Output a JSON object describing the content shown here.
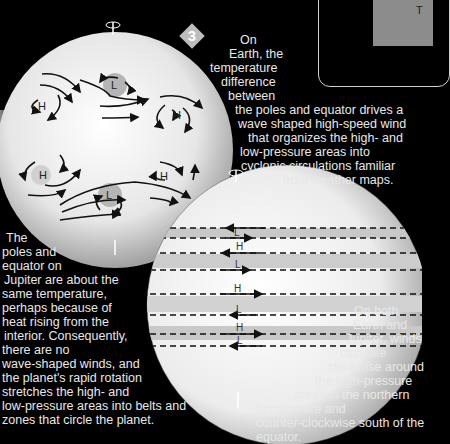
{
  "badge": {
    "number": "3",
    "color": "#bdbdbd"
  },
  "inset": {
    "letter": "T"
  },
  "earth_globe": {
    "label": "Earth",
    "pressure_labels": [
      {
        "id": "north-low",
        "text": "L"
      },
      {
        "id": "north-high-left",
        "text": "H"
      },
      {
        "id": "north-high-right",
        "text": "H"
      },
      {
        "id": "south-high-left",
        "text": "H"
      },
      {
        "id": "south-high-right",
        "text": "H"
      },
      {
        "id": "south-low",
        "text": "L"
      }
    ]
  },
  "jupiter_globe": {
    "label": "Jupiter",
    "bands": [
      {
        "text": "L",
        "direction": "east"
      },
      {
        "text": "H",
        "direction": "west"
      },
      {
        "text": "L",
        "direction": "east"
      },
      {
        "text": "H",
        "direction": "east"
      },
      {
        "text": "L",
        "direction": "west"
      },
      {
        "text": "H",
        "direction": "east"
      },
      {
        "text": "L",
        "direction": "west"
      }
    ]
  },
  "captions": {
    "earth": [
      "On",
      "Earth, the",
      "temperature",
      "difference",
      "between",
      "the poles and equator drives a",
      "wave shaped high-speed wind",
      "that organizes the high- and",
      "low-pressure areas into",
      "cyclonic circulations familiar",
      "from weather maps."
    ],
    "jupiter": [
      "The",
      "poles and",
      "equator on",
      "Jupiter are about the",
      "same temperature,",
      "perhaps because of",
      "heat rising from the",
      "interior. Consequently,",
      "there are no",
      "wave-shaped winds, and",
      "the planet's rapid rotation",
      "stretches the high- and",
      "low-pressure areas into belts and",
      "zones that circle the planet."
    ],
    "both": [
      "On both",
      "Earth and",
      "Jupiter, winds",
      "circulate",
      "clockwise around",
      "the high-pressure",
      "areas in the northern",
      "hemisphere and",
      "counter-clockwise south of the",
      "equator."
    ]
  }
}
